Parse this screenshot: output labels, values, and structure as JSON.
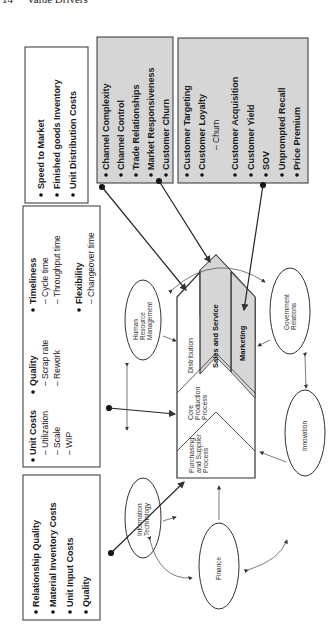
{
  "header": {
    "page_number": "14",
    "title": "Value Drivers"
  },
  "colors": {
    "gray_fill": "#d6d6d6",
    "stroke": "#333333",
    "background": "#ffffff"
  },
  "boxes": {
    "logistics": {
      "items": [
        "Speed to Market",
        "Finished goods Inventory",
        "Unit Distribution Costs"
      ]
    },
    "channel": {
      "items": [
        "Channel Complexity",
        "Channel Control",
        "Trade Relationships",
        "Market Responsiveness",
        "Customer Churn"
      ]
    },
    "customer": {
      "items": [
        "Customer Targeting",
        "Customer Loyalty",
        "– Churn",
        "Customer Acquisition",
        "Customer Yield",
        "SOV",
        "Unprompted Recall",
        "Price Premium"
      ]
    },
    "operations": {
      "unit_costs": {
        "label": "Unit Costs",
        "subs": [
          "– Utilization",
          "– Scale",
          "– WIP"
        ]
      },
      "quality": {
        "label": "Quality",
        "subs": [
          "– Scrap rate",
          "– Rework"
        ]
      },
      "timeliness": {
        "label": "Timeliness",
        "subs": [
          "– Cycle time",
          "– Throughput time"
        ]
      },
      "flexibility": {
        "label": "Flexibility",
        "subs": [
          "– Changeover time"
        ]
      }
    },
    "supplier": {
      "items": [
        "Relationship Quality",
        "Material Inventory Costs",
        "Unit Input Costs",
        "Quality"
      ]
    }
  },
  "value_chain": {
    "purchasing": [
      "Purchasing",
      "and Supplier",
      "Process"
    ],
    "core": [
      "Core",
      "Production",
      "Process"
    ],
    "distribution": "Distribution",
    "sales": "Sales and Service",
    "marketing": "Marketing"
  },
  "support": {
    "hr": [
      "Human",
      "Resource",
      "Management"
    ],
    "it": [
      "Information",
      "Technology"
    ],
    "finance": "Finance",
    "innovation": "Innovation",
    "gov": [
      "Government",
      "Relations"
    ]
  }
}
